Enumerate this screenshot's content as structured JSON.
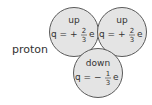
{
  "particle_label": "proton",
  "colors": {
    "fill": "#e4e4e4",
    "stroke": "#5a5a5a",
    "text": "#333333"
  },
  "quarks": [
    {
      "name": "up",
      "q_prefix": "q = +",
      "num": "2",
      "den": "3",
      "unit": "e"
    },
    {
      "name": "up",
      "q_prefix": "q = +",
      "num": "2",
      "den": "3",
      "unit": "e"
    },
    {
      "name": "down",
      "q_prefix": "q = −",
      "num": "1",
      "den": "3",
      "unit": "e"
    }
  ]
}
